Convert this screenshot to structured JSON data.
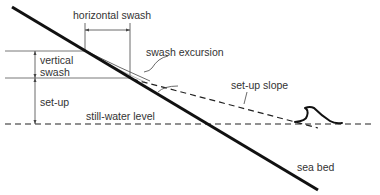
{
  "diagram": {
    "type": "coastal swash and set-up schematic",
    "labels": {
      "horizontal_swash": "horizontal swash",
      "swash_excursion": "swash excursion",
      "vertical_swash_line1": "vertical",
      "vertical_swash_line2": "swash",
      "set_up_slope": "set-up slope",
      "set_up": "set-up",
      "still_water_level": "still-water level",
      "sea_bed": "sea bed"
    },
    "elements": [
      {
        "id": "sea-bed",
        "style": "thick solid line"
      },
      {
        "id": "still-water-level",
        "style": "dashed horizontal line"
      },
      {
        "id": "set-up-slope",
        "style": "dashed sloping line"
      },
      {
        "id": "swash-excursion",
        "style": "thin curved line"
      },
      {
        "id": "breaking-wave",
        "style": "wave glyph"
      },
      {
        "id": "vertical-swash-dimension",
        "style": "dimension arrow"
      },
      {
        "id": "set-up-dimension",
        "style": "dimension arrow"
      },
      {
        "id": "horizontal-swash-dimension",
        "style": "dimension bracket"
      }
    ],
    "colors": {
      "line": "#111111",
      "thin_line": "#444444",
      "text": "#333333",
      "background": "#ffffff"
    }
  }
}
